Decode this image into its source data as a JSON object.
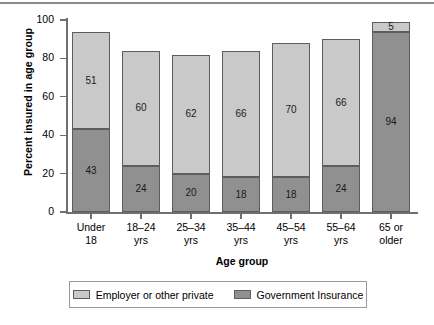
{
  "chart_data": {
    "type": "bar",
    "stacked": true,
    "title": "",
    "xlabel": "Age group",
    "ylabel": "Percent insured in age group",
    "ylim": [
      0,
      100
    ],
    "yticks": [
      0,
      20,
      40,
      60,
      80,
      100
    ],
    "grid": false,
    "legend_position": "bottom",
    "categories": [
      "Under 18",
      "18–24 yrs",
      "25–34 yrs",
      "35–44 yrs",
      "45–54 yrs",
      "55–64 yrs",
      "65 or older"
    ],
    "category_lines": [
      [
        "Under",
        "18"
      ],
      [
        "18–24",
        "yrs"
      ],
      [
        "25–34",
        "yrs"
      ],
      [
        "35–44",
        "yrs"
      ],
      [
        "45–54",
        "yrs"
      ],
      [
        "55–64",
        "yrs"
      ],
      [
        "65 or",
        "older"
      ]
    ],
    "series": [
      {
        "name": "Government Insurance",
        "color": "#909090",
        "values": [
          43,
          24,
          20,
          18,
          18,
          24,
          94
        ]
      },
      {
        "name": "Employer or other private",
        "color": "#c9c9c9",
        "values": [
          51,
          60,
          62,
          66,
          70,
          66,
          5
        ]
      }
    ],
    "totals": [
      94,
      84,
      82,
      84,
      88,
      90,
      99
    ]
  },
  "legend": {
    "entries": [
      {
        "label": "Employer or other private",
        "swatch": "private"
      },
      {
        "label": "Government Insurance",
        "swatch": "government"
      }
    ]
  }
}
